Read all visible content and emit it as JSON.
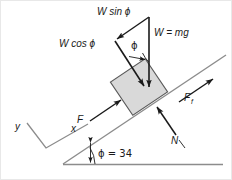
{
  "figure": {
    "labels": {
      "w_sin_phi": "W sin ϕ",
      "w_cos_phi": "W cos ϕ",
      "w_eq_mg": "W = mg",
      "phi_angle_vector": "ϕ",
      "force_applied": "F",
      "force_friction_base": "F",
      "force_friction_sub": "f",
      "normal_force": "N",
      "axis_x": "x",
      "axis_y": "y",
      "incline_angle": "ϕ = 34"
    },
    "values": {
      "incline_angle_degrees": 34,
      "incline_angle_symbol": "ϕ"
    },
    "colors": {
      "block_fill": "#d9d9d9",
      "block_stroke": "#4d4d4d",
      "line": "#7a7a7a",
      "arrow": "#1a1a1a",
      "text": "#1a1a1a",
      "background": "#ffffff",
      "border": "#e8e8e8"
    },
    "geometry": {
      "incline_start": [
        62,
        163
      ],
      "incline_end": [
        224,
        55
      ],
      "baseline_start": [
        62,
        163
      ],
      "baseline_end": [
        222,
        163
      ],
      "block_center": [
        138,
        86
      ],
      "block_size": 40,
      "block_rotation_degrees": -34
    }
  }
}
